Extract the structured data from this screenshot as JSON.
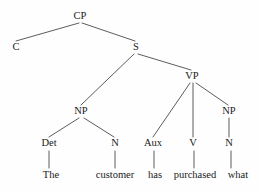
{
  "figure": {
    "kind": "syntax-tree",
    "sentence": "The customer has purchased what",
    "background_color": "#fefefe",
    "line_color": "#4a4a4a",
    "text_color": "#1a1a1a"
  },
  "nodes": [
    {
      "id": "CP",
      "label": "CP",
      "x": 80,
      "y": 19,
      "type": "category"
    },
    {
      "id": "C",
      "label": "C",
      "x": 16,
      "y": 50,
      "type": "category"
    },
    {
      "id": "S",
      "label": "S",
      "x": 136,
      "y": 50,
      "type": "category"
    },
    {
      "id": "NP1",
      "label": "NP",
      "x": 81,
      "y": 114,
      "type": "category"
    },
    {
      "id": "VP",
      "label": "VP",
      "x": 192,
      "y": 79,
      "type": "category"
    },
    {
      "id": "Det",
      "label": "Det",
      "x": 49,
      "y": 146,
      "type": "category"
    },
    {
      "id": "N1",
      "label": "N",
      "x": 115,
      "y": 146,
      "type": "category"
    },
    {
      "id": "Aux",
      "label": "Aux",
      "x": 153,
      "y": 146,
      "type": "category"
    },
    {
      "id": "V",
      "label": "V",
      "x": 193,
      "y": 146,
      "type": "category"
    },
    {
      "id": "NP2",
      "label": "NP",
      "x": 229,
      "y": 114,
      "type": "category"
    },
    {
      "id": "N2",
      "label": "N",
      "x": 229,
      "y": 146,
      "type": "category"
    },
    {
      "id": "The",
      "label": "The",
      "x": 51,
      "y": 178,
      "type": "word"
    },
    {
      "id": "customer",
      "label": "customer",
      "x": 115,
      "y": 178,
      "type": "word"
    },
    {
      "id": "has",
      "label": "has",
      "x": 155,
      "y": 178,
      "type": "word"
    },
    {
      "id": "purchased",
      "label": "purchased",
      "x": 195,
      "y": 178,
      "type": "word"
    },
    {
      "id": "what",
      "label": "what",
      "x": 238,
      "y": 178,
      "type": "word"
    }
  ],
  "edges": [
    {
      "id": "cp-c",
      "from": "CP",
      "to": "C",
      "x1": 79,
      "y1": 23,
      "x2": 16,
      "y2": 41
    },
    {
      "id": "cp-s",
      "from": "CP",
      "to": "S",
      "x1": 82,
      "y1": 23,
      "x2": 135,
      "y2": 41
    },
    {
      "id": "s-np1",
      "from": "S",
      "to": "NP1",
      "x1": 134,
      "y1": 54,
      "x2": 81,
      "y2": 105
    },
    {
      "id": "s-vp",
      "from": "S",
      "to": "VP",
      "x1": 138,
      "y1": 54,
      "x2": 191,
      "y2": 70
    },
    {
      "id": "np1-det",
      "from": "NP1",
      "to": "Det",
      "x1": 79,
      "y1": 118,
      "x2": 49,
      "y2": 137
    },
    {
      "id": "np1-n1",
      "from": "NP1",
      "to": "N1",
      "x1": 84,
      "y1": 118,
      "x2": 114,
      "y2": 137
    },
    {
      "id": "vp-aux",
      "from": "VP",
      "to": "Aux",
      "x1": 190,
      "y1": 83,
      "x2": 153,
      "y2": 137
    },
    {
      "id": "vp-v",
      "from": "VP",
      "to": "V",
      "x1": 193,
      "y1": 83,
      "x2": 193,
      "y2": 137
    },
    {
      "id": "vp-np2",
      "from": "VP",
      "to": "NP2",
      "x1": 196,
      "y1": 83,
      "x2": 228,
      "y2": 105
    },
    {
      "id": "np2-n2",
      "from": "NP2",
      "to": "N2",
      "x1": 229,
      "y1": 118,
      "x2": 229,
      "y2": 137
    },
    {
      "id": "det-the",
      "from": "Det",
      "to": "The",
      "x1": 49,
      "y1": 151,
      "x2": 49,
      "y2": 168
    },
    {
      "id": "n1-cust",
      "from": "N1",
      "to": "customer",
      "x1": 115,
      "y1": 151,
      "x2": 115,
      "y2": 168
    },
    {
      "id": "aux-has",
      "from": "Aux",
      "to": "has",
      "x1": 154,
      "y1": 151,
      "x2": 154,
      "y2": 168
    },
    {
      "id": "v-purch",
      "from": "V",
      "to": "purchased",
      "x1": 194,
      "y1": 151,
      "x2": 194,
      "y2": 168
    },
    {
      "id": "n2-what",
      "from": "N2",
      "to": "what",
      "x1": 231,
      "y1": 151,
      "x2": 231,
      "y2": 168
    }
  ]
}
